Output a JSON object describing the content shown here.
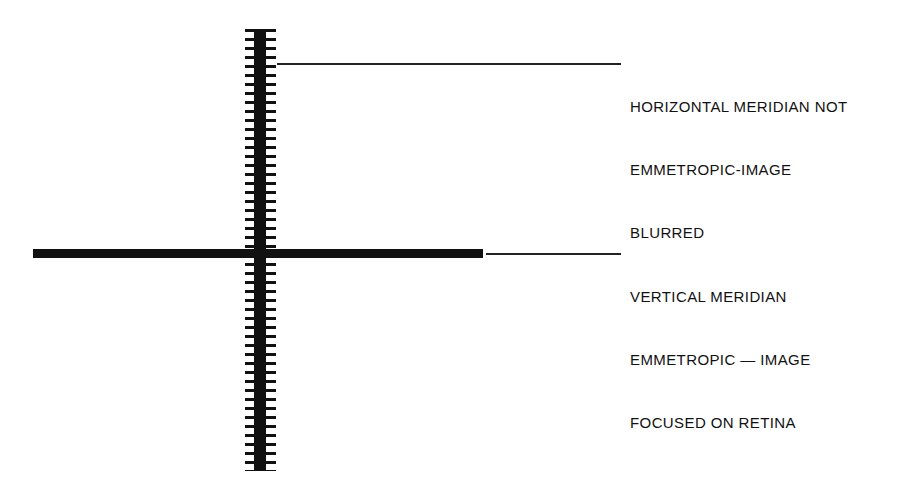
{
  "figure": {
    "background_color": "#ffffff",
    "ink_color": "#111111",
    "width": 901,
    "height": 495
  },
  "shapes": {
    "horizontal_bar": {
      "name": "sharp-horizontal-bar",
      "description": "solid black horizontal bar - sharply focused image",
      "focus_state": "focused"
    },
    "vertical_bar": {
      "name": "blurred-vertical-bar",
      "description": "black vertical bar with comb-like horizontal fringes - blurred image",
      "focus_state": "blurred"
    }
  },
  "annotations": {
    "top": {
      "lines": [
        "HORIZONTAL MERIDIAN NOT",
        "EMMETROPIC-IMAGE",
        "BLURRED"
      ],
      "line1": "HORIZONTAL MERIDIAN NOT",
      "line2": "EMMETROPIC-IMAGE",
      "line3": "BLURRED"
    },
    "bottom": {
      "lines": [
        "VERTICAL MERIDIAN",
        "EMMETROPIC — IMAGE",
        "FOCUSED ON RETINA"
      ],
      "line1": "VERTICAL MERIDIAN",
      "line2": "EMMETROPIC — IMAGE",
      "line3": "FOCUSED ON RETINA"
    }
  },
  "leaders": {
    "top_label": "leader line from vertical blurred bar to top annotation",
    "bottom_label": "leader line from horizontal sharp bar to bottom annotation"
  }
}
